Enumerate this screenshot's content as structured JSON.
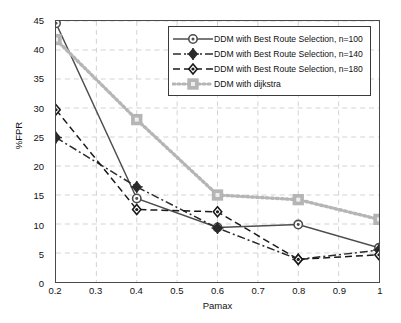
{
  "chart_data": {
    "type": "line",
    "title": "",
    "xlabel": "Pamax",
    "ylabel": "%FPR",
    "x": [
      0.2,
      0.4,
      0.6,
      0.8,
      1.0
    ],
    "xlim": [
      0.2,
      1.0
    ],
    "ylim": [
      0,
      45
    ],
    "xticks": [
      "0.2",
      "0.3",
      "0.4",
      "0.5",
      "0.6",
      "0.7",
      "0.8",
      "0.9",
      "1"
    ],
    "xtick_values": [
      0.2,
      0.3,
      0.4,
      0.5,
      0.6,
      0.7,
      0.8,
      0.9,
      1.0
    ],
    "yticks": [
      "0",
      "5",
      "10",
      "15",
      "20",
      "25",
      "30",
      "35",
      "40",
      "45"
    ],
    "ytick_values": [
      0,
      5,
      10,
      15,
      20,
      25,
      30,
      35,
      40,
      45
    ],
    "grid": true,
    "legend_position": "top-right",
    "series": [
      {
        "name": "DDM with Best Route Selection, n=100",
        "values": [
          44.6,
          14.4,
          9.4,
          9.9,
          5.9
        ],
        "color": "#4d4d4d",
        "linestyle": "solid",
        "marker": "circle"
      },
      {
        "name": "DDM with Best Route Selection, n=140",
        "values": [
          24.9,
          16.4,
          9.3,
          3.9,
          5.5
        ],
        "color": "#2b2b2b",
        "linestyle": "dashdot",
        "marker": "plus-diamond"
      },
      {
        "name": "DDM with Best Route Selection, n=180",
        "values": [
          29.7,
          12.5,
          12.1,
          3.9,
          4.7
        ],
        "color": "#1a1a1a",
        "linestyle": "dashed",
        "marker": "diamond"
      },
      {
        "name": "DDM with dijkstra",
        "values": [
          41.8,
          28.0,
          15.0,
          14.2,
          10.8
        ],
        "color": "#b5b5b5",
        "linestyle": "dotted",
        "marker": "square"
      }
    ]
  },
  "colors": {
    "axis": "#4a4a4a",
    "grid": "#c8c8c8",
    "background": "#ffffff",
    "series_100": "#4d4d4d",
    "series_140": "#2b2b2b",
    "series_180": "#1a1a1a",
    "series_dijkstra": "#b5b5b5"
  }
}
